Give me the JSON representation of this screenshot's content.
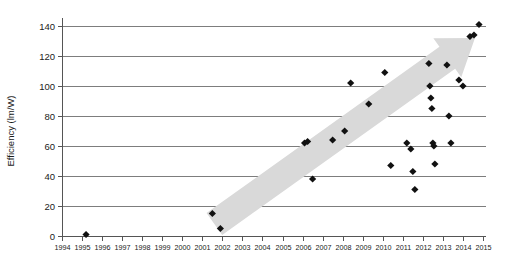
{
  "chart_data": {
    "type": "scatter",
    "title": "",
    "subtitle": "",
    "xlabel": "",
    "ylabel": "Efficiency (lm/W)",
    "xlim": [
      1994,
      2015
    ],
    "ylim": [
      0,
      140
    ],
    "grid": true,
    "legend": null,
    "x_ticks": [
      1994,
      1995,
      1996,
      1997,
      1998,
      1999,
      2000,
      2001,
      2002,
      2003,
      2004,
      2005,
      2006,
      2007,
      2008,
      2009,
      2010,
      2011,
      2012,
      2013,
      2014,
      2015
    ],
    "x_tick_labels": [
      "1994",
      "1995",
      "1996",
      "1997",
      "1998",
      "1999",
      "2000",
      "2001",
      "2002",
      "2003",
      "2004",
      "2005",
      "2006",
      "2007",
      "2008",
      "2009",
      "2010",
      "2011",
      "2012",
      "2013",
      "2014",
      "2015"
    ],
    "y_ticks": [
      0,
      20,
      40,
      60,
      80,
      100,
      120,
      140
    ],
    "y_tick_labels": [
      "0",
      "20",
      "40",
      "60",
      "80",
      "100",
      "120",
      "140"
    ],
    "marker": "diamond",
    "marker_color": "#111111",
    "gridline_color": "#7d7d7d",
    "annotation": {
      "name": "trend-arrow",
      "shape": "upward-arrow",
      "color": "#d9d9d9",
      "from": [
        2001.6,
        8
      ],
      "to": [
        2014.6,
        132
      ]
    },
    "series": [
      {
        "name": "LED luminous efficacy",
        "points": [
          [
            1995.2,
            1
          ],
          [
            2001.5,
            15
          ],
          [
            2001.9,
            5
          ],
          [
            2006.1,
            62
          ],
          [
            2006.25,
            63
          ],
          [
            2006.5,
            38
          ],
          [
            2007.5,
            64
          ],
          [
            2008.1,
            70
          ],
          [
            2008.4,
            102
          ],
          [
            2009.3,
            88
          ],
          [
            2010.1,
            109
          ],
          [
            2010.4,
            47
          ],
          [
            2011.2,
            62
          ],
          [
            2011.4,
            58
          ],
          [
            2011.5,
            43
          ],
          [
            2011.6,
            31
          ],
          [
            2012.3,
            115
          ],
          [
            2012.35,
            100
          ],
          [
            2012.4,
            92
          ],
          [
            2012.45,
            85
          ],
          [
            2012.5,
            62
          ],
          [
            2012.55,
            60
          ],
          [
            2012.6,
            48
          ],
          [
            2013.2,
            114
          ],
          [
            2013.3,
            80
          ],
          [
            2013.4,
            62
          ],
          [
            2013.8,
            104
          ],
          [
            2014.0,
            100
          ],
          [
            2014.35,
            133
          ],
          [
            2014.55,
            134
          ],
          [
            2014.8,
            141
          ]
        ]
      }
    ]
  }
}
